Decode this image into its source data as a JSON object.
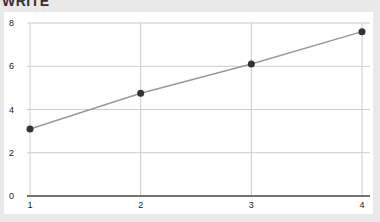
{
  "heading": "WRITE",
  "chart_data": {
    "type": "line",
    "title": "",
    "xlabel": "",
    "ylabel": "",
    "x": [
      1,
      2,
      3,
      4
    ],
    "series": [
      {
        "name": "series-1",
        "values": [
          3.1,
          4.75,
          6.1,
          7.6
        ],
        "color": "#999999",
        "marker_color": "#333333"
      }
    ],
    "x_ticks": [
      "1",
      "2",
      "3",
      "4"
    ],
    "y_ticks": [
      "0",
      "2",
      "4",
      "6",
      "8"
    ],
    "xlim": [
      1,
      4
    ],
    "ylim": [
      0,
      8
    ],
    "grid": true,
    "legend": "none"
  }
}
